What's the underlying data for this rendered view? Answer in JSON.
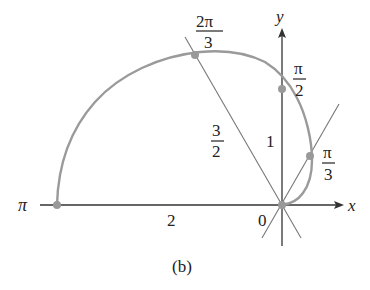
{
  "figure": {
    "caption": "(b)",
    "curve": "r = 1 - cos θ (upper half)",
    "colors": {
      "curve": "#9a9a9a",
      "axes": "#333333",
      "lines": "#777777",
      "points": "#999999",
      "text": "#222222"
    }
  },
  "axes": {
    "x_label": "x",
    "y_label": "y",
    "origin_label": "0"
  },
  "points": [
    {
      "angle_num": "π",
      "angle_den": "",
      "label": "π",
      "r": 2
    },
    {
      "angle_num": "2π",
      "angle_den": "3",
      "r": 1.5
    },
    {
      "angle_num": "π",
      "angle_den": "2",
      "r": 1
    },
    {
      "angle_num": "π",
      "angle_den": "3",
      "r": 0.5
    }
  ],
  "radius_labels": {
    "r_pi": "2",
    "r_2pi3_num": "3",
    "r_2pi3_den": "2",
    "r_pi2": "1"
  }
}
